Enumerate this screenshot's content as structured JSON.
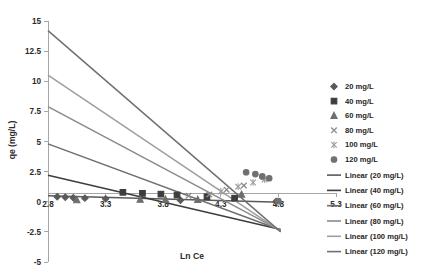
{
  "chart_data": {
    "type": "scatter",
    "title": "",
    "xlabel": "Ln Ce",
    "ylabel": "qe (mg/L)",
    "xlim": [
      2.8,
      5.3
    ],
    "ylim": [
      -5,
      15
    ],
    "xticks": [
      "2.8",
      "3.3",
      "3.8",
      "4.3",
      "4.8",
      "5.3"
    ],
    "xtick_values": [
      2.8,
      3.3,
      3.8,
      4.3,
      4.8,
      5.3
    ],
    "yticks": [
      "15",
      "12.5",
      "10",
      "7.5",
      "5",
      "2.5",
      "0",
      "-2.5",
      "-5"
    ],
    "ytick_values": [
      15,
      12.5,
      10,
      7.5,
      5,
      2.5,
      0,
      -2.5,
      -5
    ],
    "grid": false,
    "legend_position": "right",
    "series": [
      {
        "name": "20 mg/L",
        "marker": "diamond",
        "color": "#5a5a5a",
        "points": [
          {
            "x": 2.88,
            "y": 0.42
          },
          {
            "x": 2.95,
            "y": 0.38
          },
          {
            "x": 3.02,
            "y": 0.33
          },
          {
            "x": 3.12,
            "y": 0.3
          },
          {
            "x": 3.3,
            "y": 0.24
          },
          {
            "x": 3.95,
            "y": 0.12
          },
          {
            "x": 4.78,
            "y": 0.02
          }
        ],
        "fit": {
          "x0": 2.8,
          "y0": 0.5,
          "x1": 4.82,
          "y1": -0.05
        }
      },
      {
        "name": "40 mg/L",
        "marker": "square",
        "color": "#3d3d3d",
        "points": [
          {
            "x": 3.45,
            "y": 0.78
          },
          {
            "x": 3.62,
            "y": 0.7
          },
          {
            "x": 3.78,
            "y": 0.63
          },
          {
            "x": 3.92,
            "y": 0.56
          },
          {
            "x": 4.18,
            "y": 0.42
          },
          {
            "x": 4.42,
            "y": 0.3
          }
        ],
        "fit": {
          "x0": 2.8,
          "y0": 2.2,
          "x1": 4.82,
          "y1": -2.3
        }
      },
      {
        "name": "60 mg/L",
        "marker": "triangle",
        "color": "#6e6e6e",
        "points": [
          {
            "x": 3.05,
            "y": 0.15
          },
          {
            "x": 3.6,
            "y": 0.2
          },
          {
            "x": 3.82,
            "y": 0.2
          },
          {
            "x": 4.1,
            "y": 0.18
          },
          {
            "x": 4.48,
            "y": 0.6
          }
        ],
        "fit": {
          "x0": 2.8,
          "y0": 4.8,
          "x1": 4.82,
          "y1": -2.35
        }
      },
      {
        "name": "80 mg/L",
        "marker": "cross",
        "color": "#8a8a8a",
        "points": [
          {
            "x": 4.02,
            "y": 0.5
          },
          {
            "x": 4.2,
            "y": 0.6
          },
          {
            "x": 4.35,
            "y": 1.0
          },
          {
            "x": 4.5,
            "y": 1.35
          }
        ],
        "fit": {
          "x0": 2.8,
          "y0": 7.9,
          "x1": 4.82,
          "y1": -2.4
        }
      },
      {
        "name": "100 mg/L",
        "marker": "star",
        "color": "#9e9e9e",
        "points": [
          {
            "x": 4.3,
            "y": 0.85
          },
          {
            "x": 4.45,
            "y": 1.25
          },
          {
            "x": 4.58,
            "y": 1.6
          },
          {
            "x": 4.68,
            "y": 1.85
          }
        ],
        "fit": {
          "x0": 2.8,
          "y0": 10.5,
          "x1": 4.82,
          "y1": -2.45
        }
      },
      {
        "name": "120 mg/L",
        "marker": "circle",
        "color": "#707070",
        "points": [
          {
            "x": 4.52,
            "y": 2.45
          },
          {
            "x": 4.6,
            "y": 2.3
          },
          {
            "x": 4.66,
            "y": 2.1
          },
          {
            "x": 4.72,
            "y": 1.95
          },
          {
            "x": 4.8,
            "y": 0.05
          }
        ],
        "fit": {
          "x0": 2.8,
          "y0": 14.2,
          "x1": 4.82,
          "y1": -2.5
        }
      }
    ],
    "legend_markers": [
      {
        "label": "20 mg/L",
        "marker": "diamond",
        "color": "#5a5a5a"
      },
      {
        "label": "40 mg/L",
        "marker": "square",
        "color": "#3d3d3d"
      },
      {
        "label": "60 mg/L",
        "marker": "triangle",
        "color": "#6e6e6e"
      },
      {
        "label": "80 mg/L",
        "marker": "cross",
        "color": "#8a8a8a"
      },
      {
        "label": "100 mg/L",
        "marker": "star",
        "color": "#9e9e9e"
      },
      {
        "label": "120 mg/L",
        "marker": "circle",
        "color": "#707070"
      }
    ],
    "legend_lines": [
      {
        "label": "Linear (20 mg/L)",
        "color": "#5a5a5a"
      },
      {
        "label": "Linear (40 mg/L)",
        "color": "#3d3d3d"
      },
      {
        "label": "Linear (60 mg/L)",
        "color": "#6e6e6e"
      },
      {
        "label": "Linear (80 mg/L)",
        "color": "#8a8a8a"
      },
      {
        "label": "Linear (100 mg/L)",
        "color": "#9e9e9e"
      },
      {
        "label": "Linear (120 mg/L)",
        "color": "#707070"
      }
    ]
  }
}
